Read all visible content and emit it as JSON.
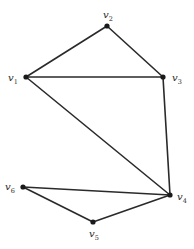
{
  "diagram": {
    "type": "undirected-graph",
    "width": 194,
    "height": 249,
    "colors": {
      "edge": "#2a2a2a",
      "node": "#1a1a1a",
      "label": "#2a2a2a",
      "background": "#ffffff"
    },
    "nodes": [
      {
        "id": "v1",
        "base": "v",
        "sub": "1",
        "x": 26,
        "y": 77,
        "lx": 8,
        "ly": 81
      },
      {
        "id": "v2",
        "base": "v",
        "sub": "2",
        "x": 107,
        "y": 26,
        "lx": 103,
        "ly": 18
      },
      {
        "id": "v3",
        "base": "v",
        "sub": "3",
        "x": 163,
        "y": 77,
        "lx": 172,
        "ly": 81
      },
      {
        "id": "v4",
        "base": "v",
        "sub": "4",
        "x": 170,
        "y": 195,
        "lx": 177,
        "ly": 200
      },
      {
        "id": "v5",
        "base": "v",
        "sub": "5",
        "x": 93,
        "y": 222,
        "lx": 89,
        "ly": 237
      },
      {
        "id": "v6",
        "base": "v",
        "sub": "6",
        "x": 23,
        "y": 187,
        "lx": 5,
        "ly": 190
      }
    ],
    "edges": [
      {
        "from": "v1",
        "to": "v2"
      },
      {
        "from": "v2",
        "to": "v3"
      },
      {
        "from": "v1",
        "to": "v3"
      },
      {
        "from": "v1",
        "to": "v4"
      },
      {
        "from": "v3",
        "to": "v4"
      },
      {
        "from": "v6",
        "to": "v4"
      },
      {
        "from": "v6",
        "to": "v5"
      },
      {
        "from": "v5",
        "to": "v4"
      }
    ]
  }
}
